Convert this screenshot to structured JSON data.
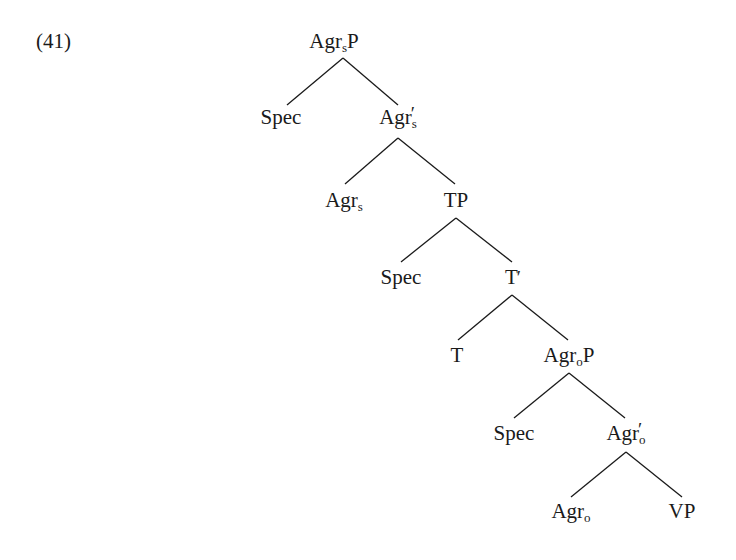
{
  "example_number": "(41)",
  "tree": {
    "nodes": [
      {
        "id": "agrsp",
        "base": "Agr",
        "sub": "s",
        "suffix": "P",
        "prime": false,
        "x": 334,
        "y": 31
      },
      {
        "id": "spec1",
        "base": "Spec",
        "sub": "",
        "suffix": "",
        "prime": false,
        "x": 281,
        "y": 107
      },
      {
        "id": "agrs-bar",
        "base": "Agr",
        "sub": "s",
        "suffix": "",
        "prime": true,
        "x": 398,
        "y": 107
      },
      {
        "id": "agrs",
        "base": "Agr",
        "sub": "s",
        "suffix": "",
        "prime": false,
        "x": 344,
        "y": 190
      },
      {
        "id": "tp",
        "base": "TP",
        "sub": "",
        "suffix": "",
        "prime": false,
        "x": 456,
        "y": 190
      },
      {
        "id": "spec2",
        "base": "Spec",
        "sub": "",
        "suffix": "",
        "prime": false,
        "x": 401,
        "y": 267
      },
      {
        "id": "t-bar",
        "base": "T",
        "sub": "",
        "suffix": "",
        "prime": true,
        "x": 513,
        "y": 267
      },
      {
        "id": "t",
        "base": "T",
        "sub": "",
        "suffix": "",
        "prime": false,
        "x": 457,
        "y": 345
      },
      {
        "id": "agrop",
        "base": "Agr",
        "sub": "o",
        "suffix": "P",
        "prime": false,
        "x": 569,
        "y": 345
      },
      {
        "id": "spec3",
        "base": "Spec",
        "sub": "",
        "suffix": "",
        "prime": false,
        "x": 514,
        "y": 423
      },
      {
        "id": "agro-bar",
        "base": "Agr",
        "sub": "o",
        "suffix": "",
        "prime": true,
        "x": 626,
        "y": 423
      },
      {
        "id": "agro",
        "base": "Agr",
        "sub": "o",
        "suffix": "",
        "prime": false,
        "x": 571,
        "y": 501
      },
      {
        "id": "vp",
        "base": "VP",
        "sub": "",
        "suffix": "",
        "prime": false,
        "x": 682,
        "y": 501
      }
    ],
    "edges": [
      {
        "from": "agrsp",
        "to": "spec1",
        "x1": 343,
        "y1": 58,
        "x2": 287,
        "y2": 105
      },
      {
        "from": "agrsp",
        "to": "agrs-bar",
        "x1": 343,
        "y1": 58,
        "x2": 398,
        "y2": 105
      },
      {
        "from": "agrs-bar",
        "to": "agrs",
        "x1": 398,
        "y1": 138,
        "x2": 345,
        "y2": 184
      },
      {
        "from": "agrs-bar",
        "to": "tp",
        "x1": 398,
        "y1": 138,
        "x2": 455,
        "y2": 184
      },
      {
        "from": "tp",
        "to": "spec2",
        "x1": 456,
        "y1": 218,
        "x2": 401,
        "y2": 262
      },
      {
        "from": "tp",
        "to": "t-bar",
        "x1": 456,
        "y1": 218,
        "x2": 512,
        "y2": 262
      },
      {
        "from": "t-bar",
        "to": "t",
        "x1": 512,
        "y1": 295,
        "x2": 458,
        "y2": 340
      },
      {
        "from": "t-bar",
        "to": "agrop",
        "x1": 512,
        "y1": 295,
        "x2": 568,
        "y2": 340
      },
      {
        "from": "agrop",
        "to": "spec3",
        "x1": 569,
        "y1": 373,
        "x2": 514,
        "y2": 418
      },
      {
        "from": "agrop",
        "to": "agro-bar",
        "x1": 569,
        "y1": 373,
        "x2": 625,
        "y2": 418
      },
      {
        "from": "agro-bar",
        "to": "agro",
        "x1": 626,
        "y1": 452,
        "x2": 571,
        "y2": 497
      },
      {
        "from": "agro-bar",
        "to": "vp",
        "x1": 626,
        "y1": 452,
        "x2": 682,
        "y2": 497
      }
    ]
  },
  "colors": {
    "ink": "#1a1a1a",
    "background": "#ffffff"
  },
  "prime_glyph": "′"
}
